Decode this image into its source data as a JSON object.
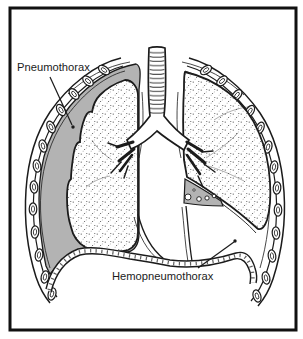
{
  "diagram": {
    "labels": {
      "pneumothorax": "Pneumothorax",
      "hemopneumothorax": "Hemopneumothorax"
    },
    "colors": {
      "ink": "#1b1b1b",
      "pleural_air_gray": "#b3b3b3",
      "paper": "#ffffff"
    }
  }
}
